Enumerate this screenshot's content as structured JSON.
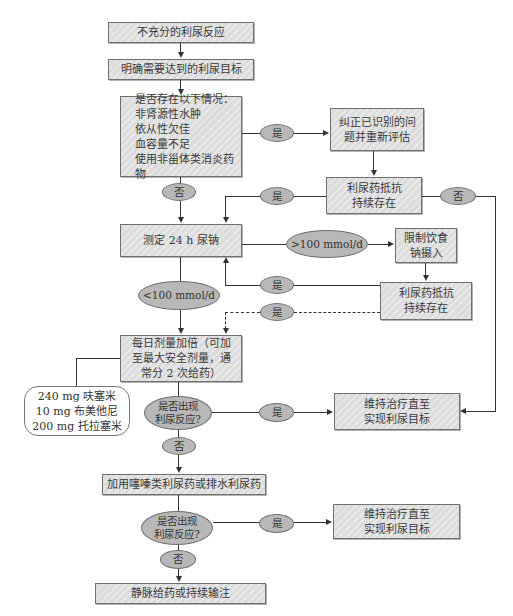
{
  "flowchart": {
    "start": "不充分的利尿反应",
    "goal": "明确需要达到的利尿目标",
    "check_conditions": "是否存在以下情况：\n非肾源性水肿\n依从性欠佳\n血容量不足\n使用非甾体类消炎药物",
    "yes_1": "是",
    "correct_problems": "纠正已识别的问\n题并重新评估",
    "resistance_1": "利尿药抵抗\n持续存在",
    "yes_2": "是",
    "no_resistance_1": "否",
    "no_1": "否",
    "measure_sodium": "测定 24 h 尿钠",
    "gt100": ">100 mmol/d",
    "restrict_sodium": "限制饮食\n钠摄入",
    "lt100": "<100 mmol/d",
    "yes_3": "是",
    "resistance_2": "利尿药抵抗\n持续存在",
    "yes_4_dashed": "是",
    "double_dose": "每日剂量加倍（可加\n至最大安全剂量，通\n常分 2 次给药）",
    "max_doses": "240 mg 呋塞米\n10 mg 布美他尼\n200 mg 托拉塞米",
    "response_q1": "是否出现\n利尿反应?",
    "yes_5": "是",
    "maintain_1": "维持治疗直至\n实现利尿目标",
    "no_2": "否",
    "add_thiazide": "加用噻嗪类利尿药或排水利尿药",
    "response_q2": "是否出现\n利尿反应?",
    "yes_6": "是",
    "maintain_2": "维持治疗直至\n实现利尿目标",
    "no_3": "否",
    "iv_infusion": "静脉给药或持续输注"
  },
  "colors": {
    "box_fill": "#dcdcdc",
    "oval_fill": "#b8b8b8",
    "line": "#333333",
    "border": "#6f6f6f"
  }
}
